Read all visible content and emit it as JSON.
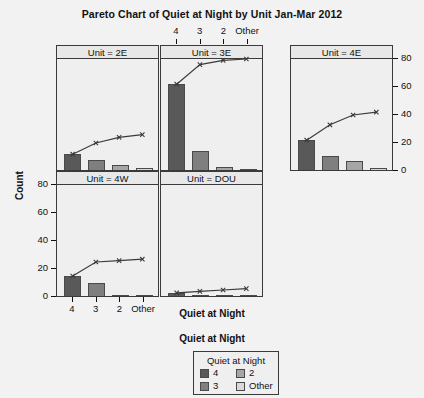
{
  "chart_data": {
    "type": "bar",
    "title": "Pareto Chart of Quiet at Night by Unit Jan-Mar 2012",
    "xlabel": "Quiet at Night",
    "ylabel": "Count",
    "ylim": [
      0,
      80
    ],
    "yticks": [
      0,
      20,
      40,
      60,
      80
    ],
    "categories": [
      "4",
      "3",
      "2",
      "Other"
    ],
    "grid": false,
    "legend_position": "bottom-center",
    "legend_title": "Quiet at Night",
    "legend_entries": [
      {
        "label": "4",
        "color": "#595959"
      },
      {
        "label": "3",
        "color": "#7f7f7f"
      },
      {
        "label": "2",
        "color": "#a6a6a6"
      },
      {
        "label": "Other",
        "color": "#d9d9d9"
      }
    ],
    "panel_variable": "Unit",
    "panels": [
      {
        "strip": "Unit = 2E",
        "unit": "2E",
        "row": 0,
        "col": 0,
        "values": [
          12,
          8,
          4,
          2
        ],
        "cumulative": [
          12,
          20,
          24,
          26
        ]
      },
      {
        "strip": "Unit = 3E",
        "unit": "3E",
        "row": 0,
        "col": 1,
        "values": [
          62,
          14,
          3,
          1
        ],
        "cumulative": [
          62,
          76,
          79,
          80
        ]
      },
      {
        "strip": "Unit = 4E",
        "unit": "4E",
        "row": 0,
        "col": 2,
        "values": [
          22,
          11,
          7,
          2
        ],
        "cumulative": [
          22,
          33,
          40,
          42
        ]
      },
      {
        "strip": "Unit = 4W",
        "unit": "4W",
        "row": 1,
        "col": 0,
        "values": [
          15,
          10,
          1,
          1
        ],
        "cumulative": [
          15,
          25,
          26,
          27
        ]
      },
      {
        "strip": "Unit = DOU",
        "unit": "DOU",
        "row": 1,
        "col": 1,
        "values": [
          3,
          1,
          1,
          1
        ],
        "cumulative": [
          3,
          4,
          5,
          6
        ]
      }
    ]
  },
  "axes": {
    "top_tick_labels": [
      "4",
      "3",
      "2",
      "Other"
    ],
    "bottom_tick_labels": [
      "4",
      "3",
      "2",
      "Other"
    ],
    "left_tick_labels": [
      "0",
      "20",
      "40",
      "60",
      "80"
    ],
    "right_tick_labels": [
      "0",
      "20",
      "40",
      "60",
      "80"
    ]
  }
}
